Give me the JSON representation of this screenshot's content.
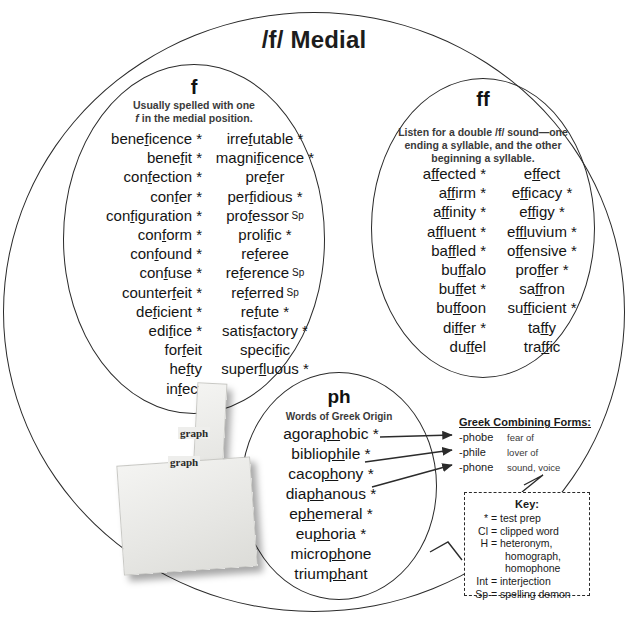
{
  "title": "/f/ Medial",
  "circles": {
    "f": {
      "label": "f",
      "subtitle_line1": "Usually spelled with one",
      "subtitle_italic": "f",
      "subtitle_line2": " in the medial position.",
      "column_left": [
        {
          "pre": "bene",
          "mark": "f",
          "post": "icence",
          "tag": "*"
        },
        {
          "pre": "bene",
          "mark": "f",
          "post": "it",
          "tag": "*"
        },
        {
          "pre": "con",
          "mark": "f",
          "post": "ection",
          "tag": "*"
        },
        {
          "pre": "con",
          "mark": "f",
          "post": "er",
          "tag": "*"
        },
        {
          "pre": "con",
          "mark": "f",
          "post": "iguration",
          "tag": "*"
        },
        {
          "pre": "con",
          "mark": "f",
          "post": "orm",
          "tag": "*"
        },
        {
          "pre": "con",
          "mark": "f",
          "post": "ound",
          "tag": "*"
        },
        {
          "pre": "con",
          "mark": "f",
          "post": "use",
          "tag": "*"
        },
        {
          "pre": "counter",
          "mark": "f",
          "post": "eit",
          "tag": "*"
        },
        {
          "pre": "de",
          "mark": "f",
          "post": "icient",
          "tag": "*"
        },
        {
          "pre": "edi",
          "mark": "f",
          "post": "ice",
          "tag": "*"
        },
        {
          "pre": "for",
          "mark": "f",
          "post": "eit",
          "tag": ""
        },
        {
          "pre": "he",
          "mark": "f",
          "post": "ty",
          "tag": ""
        },
        {
          "pre": "in",
          "mark": "f",
          "post": "ect",
          "tag": ""
        }
      ],
      "column_right": [
        {
          "pre": "irre",
          "mark": "f",
          "post": "utable",
          "tag": "*"
        },
        {
          "pre": "magni",
          "mark": "f",
          "post": "icence",
          "tag": "*"
        },
        {
          "pre": "pre",
          "mark": "f",
          "post": "er",
          "tag": ""
        },
        {
          "pre": "per",
          "mark": "f",
          "post": "idious",
          "tag": "*"
        },
        {
          "pre": "pro",
          "mark": "f",
          "post": "essor",
          "tag": "Sp"
        },
        {
          "pre": "proli",
          "mark": "f",
          "post": "ic",
          "tag": "*"
        },
        {
          "pre": "re",
          "mark": "f",
          "post": "eree",
          "tag": ""
        },
        {
          "pre": "re",
          "mark": "f",
          "post": "erence",
          "tag": "Sp"
        },
        {
          "pre": "re",
          "mark": "f",
          "post": "erred",
          "tag": "Sp"
        },
        {
          "pre": "re",
          "mark": "f",
          "post": "ute",
          "tag": "*"
        },
        {
          "pre": "satis",
          "mark": "f",
          "post": "actory",
          "tag": "*"
        },
        {
          "pre": "speci",
          "mark": "f",
          "post": "ic",
          "tag": ""
        },
        {
          "pre": "super",
          "mark": "fl",
          "post": "uous",
          "tag": "*"
        }
      ]
    },
    "ff": {
      "label": "ff",
      "subtitle": "Listen for a double /f/ sound—one ending a syllable, and the other beginning a syllable.",
      "column_left": [
        {
          "pre": "a",
          "mark": "ff",
          "post": "ected",
          "tag": "*"
        },
        {
          "pre": "a",
          "mark": "ff",
          "post": "irm",
          "tag": "*"
        },
        {
          "pre": "a",
          "mark": "ff",
          "post": "inity",
          "tag": "*"
        },
        {
          "pre": "a",
          "mark": "ff",
          "post": "luent",
          "tag": "*"
        },
        {
          "pre": "ba",
          "mark": "ff",
          "post": "led",
          "tag": "*"
        },
        {
          "pre": "bu",
          "mark": "ff",
          "post": "alo",
          "tag": ""
        },
        {
          "pre": "bu",
          "mark": "ff",
          "post": "et",
          "tag": "*"
        },
        {
          "pre": "bu",
          "mark": "ff",
          "post": "oon",
          "tag": ""
        },
        {
          "pre": "di",
          "mark": "ff",
          "post": "er",
          "tag": "*"
        },
        {
          "pre": "du",
          "mark": "ff",
          "post": "el",
          "tag": ""
        }
      ],
      "column_right": [
        {
          "pre": "e",
          "mark": "ff",
          "post": "ect",
          "tag": ""
        },
        {
          "pre": "e",
          "mark": "ff",
          "post": "icacy",
          "tag": "*"
        },
        {
          "pre": "e",
          "mark": "ff",
          "post": "igy",
          "tag": "*"
        },
        {
          "pre": "e",
          "mark": "ffl",
          "post": "uvium",
          "tag": "*"
        },
        {
          "pre": "o",
          "mark": "ff",
          "post": "ensive",
          "tag": "*"
        },
        {
          "pre": "pro",
          "mark": "ff",
          "post": "er",
          "tag": "*"
        },
        {
          "pre": "sa",
          "mark": "ff",
          "post": "ron",
          "tag": ""
        },
        {
          "pre": "su",
          "mark": "ff",
          "post": "icient",
          "tag": "*"
        },
        {
          "pre": "ta",
          "mark": "ff",
          "post": "y",
          "tag": ""
        },
        {
          "pre": "tra",
          "mark": "ff",
          "post": "ic",
          "tag": ""
        }
      ]
    },
    "ph": {
      "label": "ph",
      "subtitle": "Words of Greek Origin",
      "words": [
        {
          "pre": "agora",
          "mark": "ph",
          "post": "obic",
          "tag": "*"
        },
        {
          "pre": "biblio",
          "mark": "ph",
          "post": "ile",
          "tag": "*"
        },
        {
          "pre": "caco",
          "mark": "ph",
          "post": "ony",
          "tag": "*"
        },
        {
          "pre": "dia",
          "mark": "ph",
          "post": "anous",
          "tag": "*"
        },
        {
          "pre": "e",
          "mark": "ph",
          "post": "emeral",
          "tag": "*"
        },
        {
          "pre": "eu",
          "mark": "ph",
          "post": "oria",
          "tag": "*"
        },
        {
          "pre": "micro",
          "mark": "ph",
          "post": "one",
          "tag": ""
        },
        {
          "pre": "trium",
          "mark": "ph",
          "post": "ant",
          "tag": ""
        }
      ]
    }
  },
  "greek_forms": {
    "title": "Greek Combining Forms:",
    "rows": [
      {
        "form": "-phobe",
        "meaning": "fear of"
      },
      {
        "form": "-phile",
        "meaning": "lover of"
      },
      {
        "form": "-phone",
        "meaning": "sound, voice"
      }
    ]
  },
  "key": {
    "title": "Key:",
    "rows": [
      {
        "symbol": "*",
        "text": "= test prep",
        "indent": false
      },
      {
        "symbol": "Cl",
        "text": "= clipped word",
        "indent": false
      },
      {
        "symbol": "H",
        "text": "= heteronym,",
        "indent": false
      },
      {
        "symbol": "",
        "text": "homograph,",
        "indent": true
      },
      {
        "symbol": "",
        "text": "homophone",
        "indent": true
      },
      {
        "symbol": "Int",
        "text": "= interjection",
        "indent": false
      },
      {
        "symbol": "Sp",
        "text": "= spelling demon",
        "indent": false
      }
    ]
  },
  "note_photo": {
    "word_1": "graph",
    "word_2": "graph"
  },
  "colors": {
    "stroke": "#2b2b2b",
    "text": "#141414",
    "subtitle": "#3a3a3a"
  }
}
